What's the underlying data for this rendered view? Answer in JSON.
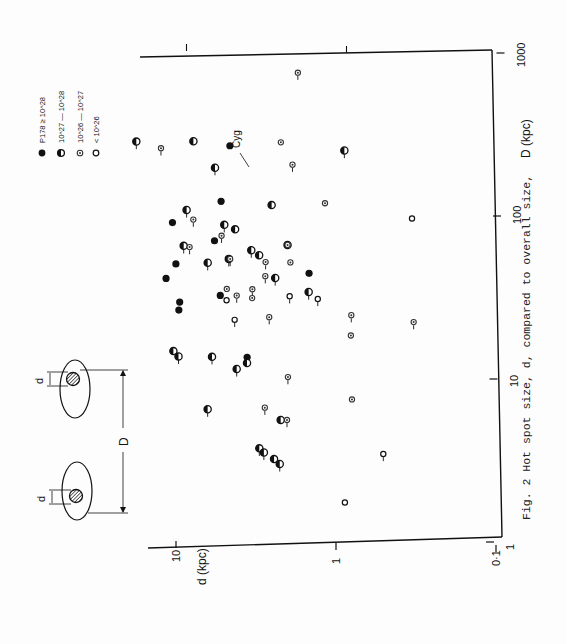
{
  "figure": {
    "caption": "Fig. 2  Hot spot size, d, compared to overall size,",
    "annotation": "Cyg",
    "diagram": {
      "label_small": "d",
      "label_large": "D"
    }
  },
  "chart_data": {
    "type": "scatter",
    "title": "Hot spot size, d, compared to overall size",
    "xlabel": "D (kpc)",
    "ylabel": "d (kpc)",
    "xscale": "log",
    "yscale": "log",
    "xlim": [
      1,
      1000
    ],
    "ylim": [
      0.1,
      10
    ],
    "x_ticks": [
      "1",
      "10",
      "100",
      "1000"
    ],
    "y_ticks": [
      "0·1",
      "1",
      "10"
    ],
    "orientation": "figure rotated 90° counter-clockwise on page",
    "legend": [
      {
        "marker": "filled",
        "label": "P178 ≥ 10^28"
      },
      {
        "marker": "half",
        "label": "10^27 — 10^28"
      },
      {
        "marker": "dot",
        "label": "10^26 — 10^27"
      },
      {
        "marker": "open",
        "label": "< 10^26"
      }
    ],
    "series": [
      {
        "name": "P178 >= 1e28",
        "marker": "filled",
        "points": [
          [
            257,
            5.2
          ],
          [
            117,
            5.8
          ],
          [
            86,
            11.6
          ],
          [
            67,
            6.3
          ],
          [
            48,
            10.9
          ],
          [
            39,
            12.5
          ],
          [
            31,
            5.7
          ],
          [
            28,
            10.2
          ],
          [
            25,
            10.3
          ],
          [
            13,
            3.8
          ],
          [
            43,
            1.6
          ]
        ]
      },
      {
        "name": "1e27 - 1e28",
        "marker": "half",
        "points": [
          [
            268,
            20
          ],
          [
            272,
            8.8
          ],
          [
            245,
            1.0
          ],
          [
            188,
            6.4
          ],
          [
            112,
            2.8
          ],
          [
            103,
            9.5
          ],
          [
            84,
            5.5
          ],
          [
            79,
            4.7
          ],
          [
            62,
            9.8
          ],
          [
            59,
            3.7
          ],
          [
            55,
            3.3
          ],
          [
            52,
            5.1
          ],
          [
            49,
            6.9
          ],
          [
            64,
            2.2
          ],
          [
            40,
            2.6
          ],
          [
            33,
            1.6
          ],
          [
            14,
            11.0
          ],
          [
            13,
            10.2
          ],
          [
            13,
            6.3
          ],
          [
            12,
            3.8
          ],
          [
            11,
            4.4
          ],
          [
            6.2,
            6.6
          ],
          [
            5.4,
            2.3
          ],
          [
            3.6,
            3.1
          ],
          [
            3.4,
            2.9
          ],
          [
            3.1,
            2.5
          ],
          [
            2.9,
            2.3
          ]
        ]
      },
      {
        "name": "1e26 - 1e27",
        "marker": "dot",
        "points": [
          [
            730,
            2.0
          ],
          [
            272,
            2.5
          ],
          [
            245,
            14.0
          ],
          [
            199,
            2.1
          ],
          [
            116,
            1.3
          ],
          [
            90,
            8.6
          ],
          [
            72,
            5.7
          ],
          [
            64,
            2.2
          ],
          [
            61,
            9.0
          ],
          [
            52,
            5.0
          ],
          [
            50,
            2.1
          ],
          [
            50,
            3.0
          ],
          [
            41,
            3.0
          ],
          [
            34,
            5.2
          ],
          [
            31,
            4.5
          ],
          [
            34,
            3.6
          ],
          [
            30,
            3.6
          ],
          [
            23,
            2.8
          ],
          [
            24,
            0.86
          ],
          [
            18,
            0.86
          ],
          [
            22,
            0.35
          ],
          [
            9.9,
            2.1
          ],
          [
            7.3,
            0.83
          ],
          [
            6.4,
            2.9
          ],
          [
            5.4,
            2.1
          ]
        ]
      },
      {
        "name": "< 1e26",
        "marker": "open",
        "points": [
          [
            95,
            0.37
          ],
          [
            31,
            2.1
          ],
          [
            30,
            1.4
          ],
          [
            29,
            5.2
          ],
          [
            22,
            4.6
          ],
          [
            3.4,
            0.52
          ],
          [
            1.7,
            0.89
          ]
        ]
      }
    ]
  }
}
